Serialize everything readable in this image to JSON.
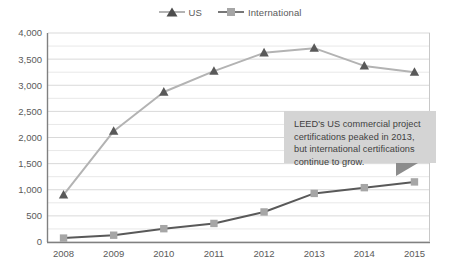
{
  "chart_data": {
    "type": "line",
    "title": "",
    "subtitle": "",
    "xlabel": "",
    "ylabel": "",
    "categories": [
      "2008",
      "2009",
      "2010",
      "2011",
      "2012",
      "2013",
      "2014",
      "2015"
    ],
    "series": [
      {
        "name": "US",
        "color": "#595959",
        "line_color": "#b3b3b3",
        "marker": "triangle",
        "values": [
          900,
          2120,
          2870,
          3270,
          3620,
          3710,
          3370,
          3250
        ]
      },
      {
        "name": "International",
        "color": "#a6a6a6",
        "line_color": "#595959",
        "marker": "square",
        "values": [
          75,
          130,
          255,
          355,
          575,
          930,
          1040,
          1150
        ]
      }
    ],
    "ylim": [
      0,
      4000
    ],
    "yticks": [
      "0",
      "500",
      "1,000",
      "1,500",
      "2,000",
      "2,500",
      "3,000",
      "3,500",
      "4,000"
    ],
    "ytick_values": [
      0,
      500,
      1000,
      1500,
      2000,
      2500,
      3000,
      3500,
      4000
    ],
    "grid": true,
    "grid_color": "#d9d9d9",
    "legend_position": "top-center",
    "annotations": [
      {
        "text": "LEED's US commercial project certifications peaked in 2013, but international certifications continue to grow.",
        "background": "#d4d4d4",
        "tail": "bottom-right"
      }
    ]
  },
  "legend": {
    "entries": [
      {
        "label": "US",
        "marker": "triangle-marker"
      },
      {
        "label": "International",
        "marker": "square-marker"
      }
    ]
  },
  "axes": {
    "y_labels": [
      "4,000",
      "3,500",
      "3,000",
      "2,500",
      "2,000",
      "1,500",
      "1,000",
      "500",
      "0"
    ],
    "x_labels": [
      "2008",
      "2009",
      "2010",
      "2011",
      "2012",
      "2013",
      "2014",
      "2015"
    ]
  },
  "callout": {
    "text": "LEED's US commercial project certifications peaked in 2013, but international certifications continue to grow."
  }
}
